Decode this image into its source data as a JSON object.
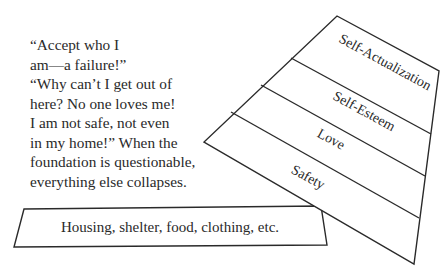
{
  "quote": {
    "lines": [
      "“Accept who I",
      "am—a failure!”",
      "“Why can’t I get out of",
      "here? No one loves me!",
      "I am not safe, not even",
      "in my home!” When the",
      "foundation is questionable,",
      "everything else collapses."
    ]
  },
  "pyramid": {
    "levels": [
      {
        "label": "Self-Actualization"
      },
      {
        "label": "Self-Esteem"
      },
      {
        "label": "Love"
      },
      {
        "label": "Safety"
      }
    ]
  },
  "base": {
    "label": "Housing, shelter, food, clothing, etc."
  },
  "colors": {
    "stroke": "#2a2a2a",
    "text": "#2a2a2a",
    "background": "#ffffff"
  }
}
